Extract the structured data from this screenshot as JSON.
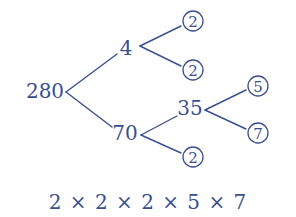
{
  "diagram": {
    "type": "factor-tree",
    "color": "#3b4f8e",
    "root": {
      "label": "280",
      "x": 45,
      "y": 98
    },
    "nodes": [
      {
        "id": "n4",
        "label": "4",
        "x": 126,
        "y": 55,
        "parent": "root"
      },
      {
        "id": "n70",
        "label": "70",
        "x": 125,
        "y": 140,
        "parent": "root"
      },
      {
        "id": "n35",
        "label": "35",
        "x": 190,
        "y": 115,
        "parent": "n70"
      }
    ],
    "leaves": [
      {
        "id": "l2a",
        "label": "2",
        "cx": 193,
        "cy": 21,
        "parent": "n4"
      },
      {
        "id": "l2b",
        "label": "2",
        "cx": 193,
        "cy": 70,
        "parent": "n4"
      },
      {
        "id": "l5",
        "label": "5",
        "cx": 258,
        "cy": 86,
        "parent": "n35"
      },
      {
        "id": "l7",
        "label": "7",
        "cx": 258,
        "cy": 133,
        "parent": "n35"
      },
      {
        "id": "l2c",
        "label": "2",
        "cx": 193,
        "cy": 157,
        "parent": "n70"
      }
    ],
    "edges": [
      {
        "from": "280",
        "to": "4",
        "x1": 66,
        "y1": 92,
        "x2": 117,
        "y2": 54
      },
      {
        "from": "280",
        "to": "70",
        "x1": 66,
        "y1": 92,
        "x2": 112,
        "y2": 127
      },
      {
        "from": "4",
        "to": "2",
        "x1": 140,
        "y1": 46,
        "x2": 181,
        "y2": 26
      },
      {
        "from": "4",
        "to": "2",
        "x1": 140,
        "y1": 46,
        "x2": 181,
        "y2": 66
      },
      {
        "from": "70",
        "to": "35",
        "x1": 141,
        "y1": 135,
        "x2": 177,
        "y2": 116
      },
      {
        "from": "70",
        "to": "2",
        "x1": 141,
        "y1": 135,
        "x2": 181,
        "y2": 153
      },
      {
        "from": "35",
        "to": "5",
        "x1": 205,
        "y1": 110,
        "x2": 246,
        "y2": 90
      },
      {
        "from": "35",
        "to": "7",
        "x1": 205,
        "y1": 110,
        "x2": 246,
        "y2": 129
      }
    ],
    "circle_radius": 10,
    "formula": "2 × 2 × 2 × 5 × 7"
  }
}
